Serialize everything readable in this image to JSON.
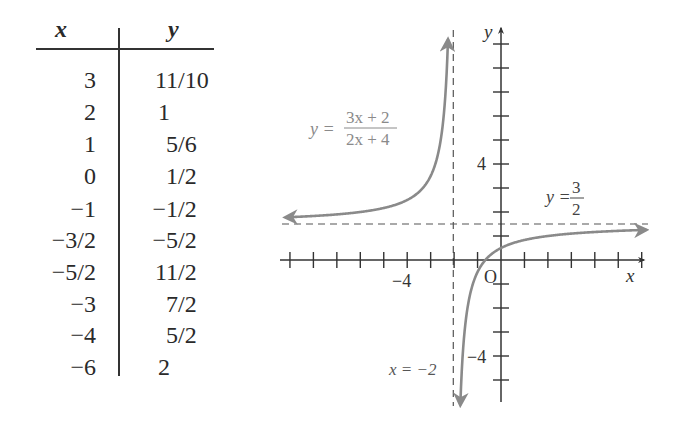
{
  "table": {
    "headers": {
      "x": "x",
      "y": "y"
    },
    "rows": [
      {
        "x": "3",
        "y": "11/10"
      },
      {
        "x": "2",
        "y": "1"
      },
      {
        "x": "1",
        "y": "5/6"
      },
      {
        "x": "0",
        "y": "1/2"
      },
      {
        "x": "−1",
        "y": "−1/2"
      },
      {
        "x": "−3/2",
        "y": "−5/2"
      },
      {
        "x": "−5/2",
        "y": "11/2"
      },
      {
        "x": "−3",
        "y": "7/2"
      },
      {
        "x": "−4",
        "y": "5/2"
      },
      {
        "x": "−6",
        "y": "2"
      }
    ]
  },
  "graph": {
    "function_label": {
      "lhs": "y =",
      "numerator": "3x + 2",
      "denominator": "2x + 4"
    },
    "horizontal_asymptote_label": {
      "lhs": "y =",
      "numerator": "3",
      "denominator": "2"
    },
    "vertical_asymptote_label": "x = −2",
    "x_axis_label": "x",
    "y_axis_label": "y",
    "origin_label": "O",
    "x_tick_label": "−4",
    "y_tick_label_pos": "4",
    "y_tick_label_neg": "−4",
    "colors": {
      "curve": "#8a8a8a",
      "axis": "#333333",
      "asymptote": "#555555",
      "label_gray": "#8a8a8a"
    }
  },
  "chart_data": {
    "type": "line",
    "title": "",
    "function": "y = (3x + 2)/(2x + 4)",
    "xlabel": "x",
    "ylabel": "y",
    "xlim": [
      -9,
      6
    ],
    "ylim": [
      -6,
      9
    ],
    "x_ticks": [
      -9,
      -8,
      -7,
      -6,
      -5,
      -4,
      -3,
      -2,
      -1,
      1,
      2,
      3,
      4,
      5,
      6
    ],
    "x_tick_labels": {
      "-4": "−4"
    },
    "y_ticks": [
      -5,
      -4,
      -3,
      -2,
      -1,
      1,
      2,
      3,
      4,
      5,
      6,
      7,
      8,
      9
    ],
    "y_tick_labels": {
      "4": "4",
      "-4": "−4"
    },
    "asymptotes": {
      "vertical": -2,
      "horizontal": 1.5
    },
    "annotations": [
      "y = (3x+2)/(2x+4)",
      "y = 3/2",
      "x = −2",
      "O"
    ],
    "grid": false,
    "series": [
      {
        "name": "left branch",
        "x": [
          -9,
          -8,
          -6,
          -4,
          -3,
          -2.5,
          -2.25
        ],
        "y": [
          1.786,
          1.833,
          2,
          2.5,
          3.5,
          5.5,
          9.5
        ]
      },
      {
        "name": "right branch",
        "x": [
          -1.73,
          -1.5,
          -1,
          0,
          1,
          2,
          3,
          6
        ],
        "y": [
          -6,
          -2.5,
          -0.5,
          0.5,
          0.833,
          1,
          1.1,
          1.25
        ]
      }
    ],
    "table_points": [
      {
        "x": 3,
        "y": 1.1
      },
      {
        "x": 2,
        "y": 1
      },
      {
        "x": 1,
        "y": 0.8333
      },
      {
        "x": 0,
        "y": 0.5
      },
      {
        "x": -1,
        "y": -0.5
      },
      {
        "x": -1.5,
        "y": -2.5
      },
      {
        "x": -2.5,
        "y": 5.5
      },
      {
        "x": -3,
        "y": 3.5
      },
      {
        "x": -4,
        "y": 2.5
      },
      {
        "x": -6,
        "y": 2
      }
    ]
  }
}
